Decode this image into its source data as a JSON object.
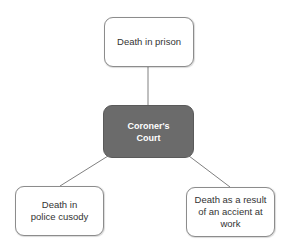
{
  "diagram": {
    "type": "hub-and-spoke",
    "center": {
      "id": "coroner",
      "label": "Coroner's\nCourt"
    },
    "nodes": [
      {
        "id": "prison",
        "label": "Death in prison"
      },
      {
        "id": "custody",
        "label": "Death in\npolice cusody"
      },
      {
        "id": "work",
        "label": "Death as a result\nof an accient at\nwork"
      }
    ],
    "edges": [
      {
        "from": "coroner",
        "to": "prison"
      },
      {
        "from": "coroner",
        "to": "custody"
      },
      {
        "from": "coroner",
        "to": "work"
      }
    ],
    "colors": {
      "hub_fill": "#6b6b6b",
      "hub_text": "#ffffff",
      "leaf_fill": "#ffffff",
      "leaf_border": "#8c8c8c",
      "edge": "#808080"
    }
  }
}
